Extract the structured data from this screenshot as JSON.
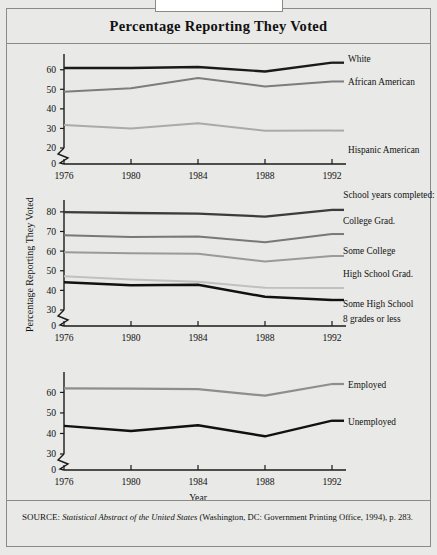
{
  "figure": {
    "title": "Percentage Reporting They Voted",
    "y_axis_label": "Percentage Reporting They Voted",
    "x_axis_label": "Year",
    "source_prefix": "SOURCE:",
    "source_italic": "Statistical Abstract of the United States",
    "source_rest": " (Washington, DC: Government Printing Office, 1994), p. 283."
  },
  "chart_data": [
    {
      "type": "line",
      "panel": "race-ethnicity",
      "title": "Percentage Reporting They Voted",
      "xlabel": "",
      "ylabel": "",
      "x": [
        1976,
        1980,
        1984,
        1988,
        1992
      ],
      "xticklabels": [
        "1976",
        "1980",
        "1984",
        "1988",
        "1992"
      ],
      "yticks": [
        0,
        20,
        30,
        40,
        50,
        60
      ],
      "yticklabels": [
        "0",
        "20",
        "30",
        "40",
        "50",
        "60"
      ],
      "ylim": [
        20,
        66
      ],
      "axis_break": true,
      "grid": false,
      "legend_position": "right-inline",
      "series": [
        {
          "name": "White",
          "values": [
            60.9,
            60.9,
            61.4,
            59.1,
            63.6
          ],
          "color": "#1a1a1a",
          "width": 2.3
        },
        {
          "name": "African American",
          "values": [
            48.7,
            50.5,
            55.8,
            51.5,
            54.0
          ],
          "color": "#7d7d7d",
          "width": 2.0
        },
        {
          "name": "Hispanic American",
          "values": [
            31.8,
            29.9,
            32.6,
            28.8,
            28.9
          ],
          "color": "#aaaaaa",
          "width": 2.0
        }
      ]
    },
    {
      "type": "line",
      "panel": "school-years-completed",
      "title": "",
      "xlabel": "",
      "ylabel": "Percentage Reporting They Voted",
      "x": [
        1976,
        1980,
        1984,
        1988,
        1992
      ],
      "xticklabels": [
        "1976",
        "1980",
        "1984",
        "1988",
        "1992"
      ],
      "yticks": [
        0,
        30,
        40,
        50,
        60,
        70,
        80
      ],
      "yticklabels": [
        "0",
        "30",
        "40",
        "50",
        "60",
        "70",
        "80"
      ],
      "ylim": [
        30,
        84
      ],
      "axis_break": true,
      "grid": false,
      "legend_title": "School years completed:",
      "legend_position": "right-inline",
      "series": [
        {
          "name": "College Grad.",
          "values": [
            79.8,
            79.4,
            79.1,
            77.6,
            81.0
          ],
          "color": "#3c3c3c",
          "width": 2.3
        },
        {
          "name": "Some College",
          "values": [
            68.1,
            67.2,
            67.5,
            64.5,
            68.7
          ],
          "color": "#787878",
          "width": 2.0
        },
        {
          "name": "High School Grad.",
          "values": [
            59.4,
            58.9,
            58.7,
            54.7,
            57.5
          ],
          "color": "#9a9a9a",
          "width": 2.0
        },
        {
          "name": "Some High School",
          "values": [
            47.2,
            45.6,
            44.4,
            41.3,
            41.2
          ],
          "color": "#c0c0c0",
          "width": 2.0
        },
        {
          "name": "8 grades or less",
          "values": [
            44.1,
            42.6,
            42.9,
            36.7,
            35.1
          ],
          "color": "#111111",
          "width": 2.4
        }
      ]
    },
    {
      "type": "line",
      "panel": "employment-status",
      "title": "",
      "xlabel": "Year",
      "ylabel": "",
      "x": [
        1976,
        1980,
        1984,
        1988,
        1992
      ],
      "xticklabels": [
        "1976",
        "1980",
        "1984",
        "1988",
        "1992"
      ],
      "yticks": [
        0,
        30,
        40,
        50,
        60
      ],
      "yticklabels": [
        "0",
        "30",
        "40",
        "50",
        "60"
      ],
      "ylim": [
        30,
        68
      ],
      "axis_break": true,
      "grid": false,
      "legend_position": "right-inline",
      "series": [
        {
          "name": "Employed",
          "values": [
            62.0,
            61.8,
            61.6,
            58.4,
            64.1
          ],
          "color": "#8e8e8e",
          "width": 2.2
        },
        {
          "name": "Unemployed",
          "values": [
            43.7,
            41.2,
            44.0,
            38.6,
            46.2
          ],
          "color": "#111111",
          "width": 2.4
        }
      ]
    }
  ]
}
